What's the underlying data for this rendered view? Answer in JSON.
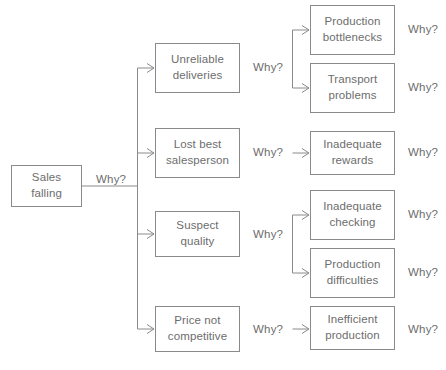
{
  "diagram": {
    "type": "why-why-tree",
    "root": {
      "label": "Sales\nfalling",
      "x": 11,
      "y": 165,
      "w": 71,
      "h": 42
    },
    "prompts": {
      "level1": "Why?",
      "level2": "Why?",
      "level3": "Why?"
    },
    "level1_prompt": {
      "label": "Why?",
      "x": 96,
      "y": 174
    },
    "level2_nodes": [
      {
        "label": "Unreliable\ndeliveries",
        "x": 155,
        "y": 43,
        "w": 85,
        "h": 50
      },
      {
        "label": "Lost best\nsalesperson",
        "x": 155,
        "y": 128,
        "w": 85,
        "h": 50
      },
      {
        "label": "Suspect\nquality",
        "x": 155,
        "y": 211,
        "w": 85,
        "h": 46
      },
      {
        "label": "Price not\ncompetitive",
        "x": 155,
        "y": 306,
        "w": 85,
        "h": 46
      }
    ],
    "level2_prompts": [
      {
        "label": "Why?",
        "x": 253,
        "y": 62
      },
      {
        "label": "Why?",
        "x": 253,
        "y": 147
      },
      {
        "label": "Why?",
        "x": 253,
        "y": 229
      },
      {
        "label": "Why?",
        "x": 253,
        "y": 324
      }
    ],
    "level3_nodes": [
      {
        "label": "Production\nbottlenecks",
        "x": 310,
        "y": 5,
        "w": 85,
        "h": 50
      },
      {
        "label": "Transport\nproblems",
        "x": 310,
        "y": 63,
        "w": 85,
        "h": 50
      },
      {
        "label": "Inadequate\nrewards",
        "x": 310,
        "y": 131,
        "w": 85,
        "h": 44
      },
      {
        "label": "Inadequate\nchecking",
        "x": 310,
        "y": 190,
        "w": 85,
        "h": 50
      },
      {
        "label": "Production\ndifficulties",
        "x": 310,
        "y": 248,
        "w": 85,
        "h": 50
      },
      {
        "label": "Inefficient\nproduction",
        "x": 310,
        "y": 306,
        "w": 85,
        "h": 44
      }
    ],
    "level3_prompts": [
      {
        "label": "Why?",
        "x": 408,
        "y": 24
      },
      {
        "label": "Why?",
        "x": 408,
        "y": 82
      },
      {
        "label": "Why?",
        "x": 408,
        "y": 147
      },
      {
        "label": "Why?",
        "x": 408,
        "y": 209
      },
      {
        "label": "Why?",
        "x": 408,
        "y": 267
      },
      {
        "label": "Why?",
        "x": 408,
        "y": 324
      }
    ],
    "caption": "",
    "colors": {
      "stroke": "#8a8a8a",
      "text": "#6d6d6d",
      "background": "#ffffff"
    }
  }
}
